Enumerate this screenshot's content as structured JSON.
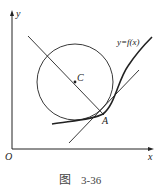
{
  "figure": {
    "caption_prefix": "图",
    "caption_number": "3-36",
    "labels": {
      "y_axis": "y",
      "x_axis": "x",
      "origin": "O",
      "center": "C",
      "point": "A",
      "curve": "y=f(x)"
    },
    "colors": {
      "stroke": "#222222",
      "background": "#ffffff"
    }
  }
}
